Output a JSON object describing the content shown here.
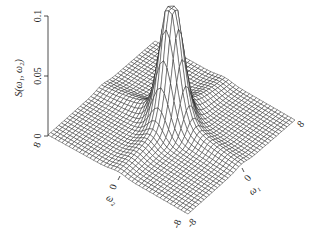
{
  "chart_data": {
    "type": "surface3d",
    "title": "",
    "zlabel": "S(ω1, ω2)",
    "zlabel_display": "S(ω₁, ω₂)",
    "xlabel": "ω1",
    "xlabel_display": "ω₁",
    "ylabel": "ω2",
    "ylabel_display": "ω₂",
    "xlim": [
      -8,
      8
    ],
    "ylim": [
      -8,
      8
    ],
    "zlim": [
      0,
      0.1
    ],
    "z_ticks": [
      "0",
      "0.05",
      "0.1"
    ],
    "x_ticks": [
      "-8",
      "0",
      "8"
    ],
    "y_ticks": [
      "-8",
      "0",
      "8"
    ],
    "x_ticks_display": [
      "-8",
      "0",
      "8"
    ],
    "y_ticks_display": [
      "-8",
      "0",
      "8"
    ],
    "surface": {
      "description": "Spectral density peak centered at origin, max ≈ 0.1, with ridges along ω1 and ω2 axes",
      "peak_value": 0.1,
      "peak_location": [
        0,
        0
      ],
      "grid_lines": 40
    },
    "grid": false,
    "mesh_color": "#1a1a1a",
    "background": "#ffffff"
  }
}
